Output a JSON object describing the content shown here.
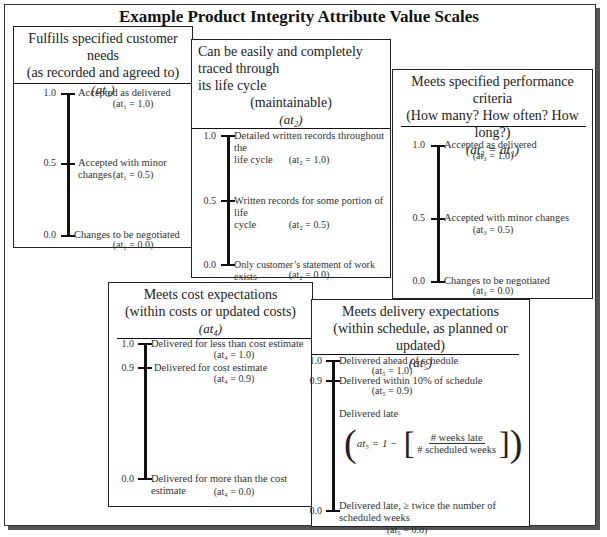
{
  "title": "Example Product Integrity Attribute Value Scales",
  "boxes": [
    {
      "id": "at1",
      "heading": [
        "Fulfills specified customer needs",
        "(as recorded and agreed to)"
      ],
      "symbol": "(at₁)",
      "scale": [
        {
          "value": "1.0",
          "label": "Accepted as delivered",
          "eq": "(at₁ = 1.0)"
        },
        {
          "value": "0.5",
          "label": "Accepted with minor changes",
          "eq": "(at₁ = 0.5)"
        },
        {
          "value": "0.0",
          "label": "Changes to be negotiated",
          "eq": "(at₁ = 0.0)"
        }
      ]
    },
    {
      "id": "at2",
      "heading": [
        "Can be easily and completely traced through",
        "its life cycle",
        "(maintainable)"
      ],
      "symbol": "(at₂)",
      "scale": [
        {
          "value": "1.0",
          "label": "Detailed written records throughout the",
          "label2": "life cycle",
          "eq": "(at₂ = 1.0)"
        },
        {
          "value": "0.5",
          "label": "Written records for some portion of life",
          "label2": "cycle",
          "eq": "(at₂ = 0.5)"
        },
        {
          "value": "0.0",
          "label": "Only customer’s statement of work exists",
          "eq": "(at₂ = 0.0)"
        }
      ]
    },
    {
      "id": "at3",
      "heading": [
        "Meets specified performance criteria",
        "(How many? How often? How long?)"
      ],
      "symbol": "(at₃ = at₁)",
      "scale": [
        {
          "value": "1.0",
          "label": "Accepted as delivered",
          "eq": "(at₃ = 1.0)"
        },
        {
          "value": "0.5",
          "label": "Accepted with minor changes",
          "eq": "(at₃ = 0.5)"
        },
        {
          "value": "0.0",
          "label": "Changes to be negotiated",
          "eq": "(at₃ = 0.0)"
        }
      ]
    },
    {
      "id": "at4",
      "heading": [
        "Meets cost expectations",
        "(within costs or updated costs)"
      ],
      "symbol": "(at₄)",
      "scale": [
        {
          "value": "1.0",
          "label": "Delivered for less than cost estimate",
          "eq": "(at₄ = 1.0)"
        },
        {
          "value": "0.9",
          "label": "Delivered for cost estimate",
          "eq": "(at₄ = 0.9)"
        },
        {
          "value": "0.0",
          "label": "Delivered for more than the cost",
          "label2": "estimate",
          "eq": "(at₄ = 0.0)"
        }
      ]
    },
    {
      "id": "at5",
      "heading": [
        "Meets delivery expectations",
        "(within schedule, as planned or updated)"
      ],
      "symbol": "(at₅)",
      "scale": [
        {
          "value": "1.0",
          "label": "Delivered ahead of schedule",
          "eq": "(at₅ = 1.0)"
        },
        {
          "value": "0.9",
          "label": "Delivered within 10% of schedule",
          "eq": "(at₅ = 0.9)"
        },
        {
          "value": "0.0",
          "label": "Delivered late, ≥ twice the number of",
          "label2": "scheduled weeks",
          "eq": "(at₅ = 0.0)"
        }
      ],
      "late": {
        "label": "Delivered late",
        "formula_lhs": "at₅ = 1 −",
        "numerator": "# weeks late",
        "denominator": "# scheduled weeks"
      }
    }
  ]
}
